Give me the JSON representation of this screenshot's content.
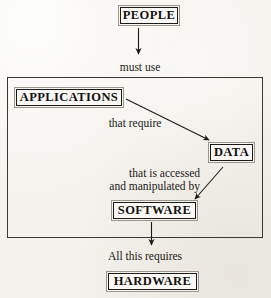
{
  "diagram": {
    "background_color": "#f4f2ed",
    "ink_color": "#1b1917",
    "nodes": [
      {
        "id": "people",
        "label": "PEOPLE"
      },
      {
        "id": "applications",
        "label": "APPLICATIONS"
      },
      {
        "id": "data",
        "label": "DATA"
      },
      {
        "id": "software",
        "label": "SOFTWARE"
      },
      {
        "id": "hardware",
        "label": "HARDWARE"
      }
    ],
    "edge_labels": {
      "must_use": "must use",
      "that_require": "that require",
      "accessed_line1": "that is accessed",
      "accessed_line2": "and manipulated by",
      "all_this_requires": "All this requires"
    },
    "edges": [
      {
        "from": "people",
        "to": "applications",
        "label": "must use",
        "style": "straight-down"
      },
      {
        "from": "applications",
        "to": "data",
        "label": "that require",
        "style": "diagonal-down-right"
      },
      {
        "from": "data",
        "to": "software",
        "label": "that is accessed and manipulated by",
        "style": "diagonal-down-left"
      },
      {
        "from": "software",
        "to": "hardware",
        "label": "All this requires",
        "style": "straight-down"
      }
    ],
    "group": {
      "contains": [
        "applications",
        "data",
        "software"
      ]
    }
  }
}
